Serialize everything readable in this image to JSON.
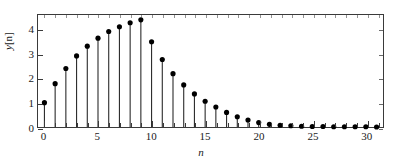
{
  "chart_data": {
    "type": "stem",
    "title": "",
    "xlabel": "n",
    "ylabel": "y[n]",
    "xlim": [
      -0.6,
      31.6
    ],
    "ylim": [
      0,
      4.6
    ],
    "grid": false,
    "legend": "none",
    "marker": "filled-circle",
    "xticks": [
      0,
      5,
      10,
      15,
      20,
      25,
      30
    ],
    "xtick_labels": [
      "0",
      "5",
      "10",
      "15",
      "20",
      "25",
      "30"
    ],
    "xtick_minor_step": 1,
    "yticks": [
      0,
      1,
      2,
      3,
      4
    ],
    "ytick_labels": [
      "0",
      "1",
      "2",
      "3",
      "4"
    ],
    "x": [
      0,
      1,
      2,
      3,
      4,
      5,
      6,
      7,
      8,
      9,
      10,
      11,
      12,
      13,
      14,
      15,
      16,
      17,
      18,
      19,
      20,
      21,
      22,
      23,
      24,
      25,
      26,
      27,
      28,
      29,
      30,
      31
    ],
    "values": [
      1.0,
      1.78,
      2.4,
      2.92,
      3.32,
      3.65,
      3.92,
      4.12,
      4.28,
      4.4,
      3.5,
      2.77,
      2.19,
      1.73,
      1.36,
      1.06,
      0.82,
      0.6,
      0.42,
      0.29,
      0.18,
      0.11,
      0.07,
      0.05,
      0.03,
      0.02,
      0.02,
      0.01,
      0.01,
      0.01,
      0.01,
      0.0
    ]
  },
  "axis_titles": {
    "x": "n",
    "y_base": "y",
    "y_index": "[n]"
  },
  "colors": {
    "axis": "#3a3a3a",
    "stem": "#2a2a2a",
    "marker": "#000000",
    "background": "#ffffff",
    "text": "#1a1a1a"
  }
}
